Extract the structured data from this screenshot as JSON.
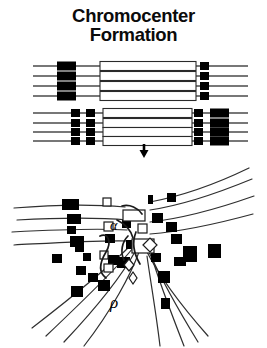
{
  "figure": {
    "title_line_1": "Chromocenter",
    "title_line_2": "Formation",
    "caption": "",
    "background_color": "#ffffff",
    "ink_color": "#000000",
    "line_color": "#4a4a4a"
  },
  "upper_panel": {
    "name": "paired-polytene-chromosomes-schematic",
    "description": "Two groups of four aligned homologous chromosome strands drawn as horizontal lines bearing solid black heterochromatic blocks and open (hollow) euchromatic segments.",
    "groups": [
      {
        "id": "group-1",
        "label": "chromosome-arm-group-upper",
        "strand_count": 4,
        "strand_y": [
          66,
          76,
          86,
          96
        ],
        "line_x_start": 33,
        "line_x_end": 248,
        "features": [
          {
            "kind": "solid-block",
            "x": 57,
            "width": 19,
            "height": 9
          },
          {
            "kind": "hollow-segment",
            "x": 100,
            "width": 96,
            "height": 9
          },
          {
            "kind": "solid-block",
            "x": 200,
            "width": 9,
            "height": 8
          }
        ]
      },
      {
        "id": "group-2",
        "label": "chromosome-arm-group-lower",
        "strand_count": 4,
        "strand_y": [
          113,
          123,
          132,
          141
        ],
        "line_x_start": 33,
        "line_x_end": 248,
        "features": [
          {
            "kind": "solid-block",
            "x": 71,
            "width": 9,
            "height": 8
          },
          {
            "kind": "solid-block",
            "x": 86,
            "width": 9,
            "height": 8
          },
          {
            "kind": "hollow-segment",
            "x": 103,
            "width": 89,
            "height": 9
          },
          {
            "kind": "solid-block",
            "x": 194,
            "width": 9,
            "height": 8
          },
          {
            "kind": "solid-block",
            "x": 210,
            "width": 19,
            "height": 9
          }
        ]
      }
    ],
    "arrow": {
      "name": "downward-process-arrow",
      "x": 144,
      "y_top": 143,
      "y_bottom": 157,
      "direction": "down"
    }
  },
  "lower_panel": {
    "name": "chromocenter-convergence-drawing",
    "description": "Hand-drawn rendering of chromosome arms converging into a central chromocenter; arms fan out to the left, right and downward, each studded with black heterochromatin blocks and a few open squares and diamonds.",
    "chromocenter": {
      "x": 140,
      "y": 232,
      "label": "chromocenter"
    },
    "arms": [
      {
        "id": "arm-left-1",
        "direction": "left"
      },
      {
        "id": "arm-left-2",
        "direction": "left"
      },
      {
        "id": "arm-left-3",
        "direction": "left"
      },
      {
        "id": "arm-left-4",
        "direction": "left"
      },
      {
        "id": "arm-right-1",
        "direction": "right"
      },
      {
        "id": "arm-right-2",
        "direction": "right"
      },
      {
        "id": "arm-right-3",
        "direction": "right"
      },
      {
        "id": "arm-right-4",
        "direction": "right"
      },
      {
        "id": "arm-down-left-1",
        "direction": "down-left"
      },
      {
        "id": "arm-down-left-2",
        "direction": "down-left"
      },
      {
        "id": "arm-down-left-3",
        "direction": "down-left"
      },
      {
        "id": "arm-down-left-4",
        "direction": "down-left"
      },
      {
        "id": "arm-down-right-1",
        "direction": "down-right"
      },
      {
        "id": "arm-down-right-2",
        "direction": "down-right"
      },
      {
        "id": "arm-down-right-3",
        "direction": "down-right"
      },
      {
        "id": "arm-down-right-4",
        "direction": "down-right"
      }
    ]
  }
}
